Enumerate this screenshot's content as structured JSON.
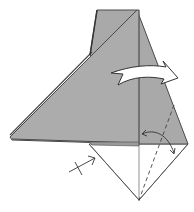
{
  "diagram": {
    "type": "origami-fold-step",
    "colors": {
      "paper_colored": "#a9a9a9",
      "paper_white": "#ffffff",
      "edge": "#4a4a4a",
      "crease": "#555555",
      "arrow_fill": "#ffffff",
      "arrow_stroke": "#333333"
    },
    "symbols": [
      {
        "name": "turn-over-flap-arrow",
        "meaning": "fold flap to the right"
      },
      {
        "name": "fold-unfold-arrow",
        "meaning": "fold and unfold along dashed line"
      },
      {
        "name": "pinch-point-arrow",
        "meaning": "pleat / push point arrow with cross"
      },
      {
        "name": "valley-fold-line",
        "meaning": "dashed valley fold line"
      }
    ]
  }
}
